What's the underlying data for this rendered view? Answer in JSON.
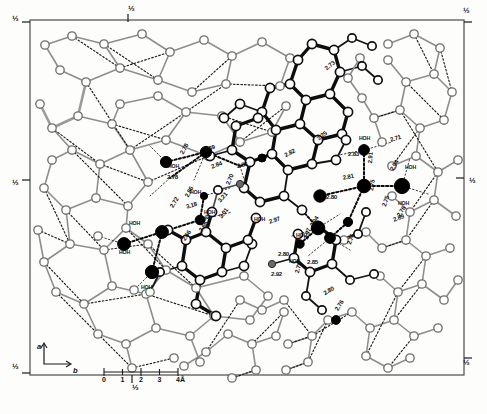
{
  "figure": {
    "kind": "crystal-packing-diagram",
    "background_color": "#fdfdfb",
    "frame_color": "#555555",
    "bond_color_light": "#888888",
    "bond_color_dark": "#111111",
    "atom_open_fill": "#ffffff",
    "atom_dark_fill": "#000000",
    "hbond_style": "dotted"
  },
  "cell_frame": {
    "x": 30,
    "y": 20,
    "width": 434,
    "height": 355,
    "edge_ticks": [
      {
        "name": "top-half-tick",
        "label": "½",
        "x": 128,
        "y": 4,
        "edge": "top"
      },
      {
        "name": "top-right-half-tick",
        "label": "½",
        "x": 463,
        "y": 6,
        "edge": "top-right"
      },
      {
        "name": "top-left-half-tick",
        "label": "½",
        "x": 12,
        "y": 14,
        "edge": "top-left"
      },
      {
        "name": "left-half-tick",
        "label": "½",
        "x": 12,
        "y": 178,
        "edge": "left"
      },
      {
        "name": "right-half-tick",
        "label": "½",
        "x": 469,
        "y": 176,
        "edge": "right"
      },
      {
        "name": "bottom-left-half-tick",
        "label": "½",
        "x": 12,
        "y": 362,
        "edge": "bottom-left"
      },
      {
        "name": "bottom-half-tick",
        "label": "½",
        "x": 132,
        "y": 383,
        "edge": "bottom"
      },
      {
        "name": "bottom-right-half-tick",
        "label": "½",
        "x": 463,
        "y": 358,
        "edge": "bottom-right"
      }
    ]
  },
  "axes": {
    "origin_label": "a",
    "horizontal_label": "b",
    "x": 44,
    "y": 352
  },
  "scale_bar": {
    "x": 104,
    "y": 372,
    "length_px": 74,
    "tick_labels": [
      "0",
      "1",
      "2",
      "3",
      "4Å"
    ],
    "unit": "Å"
  },
  "water_labels": [
    {
      "text": "HOH",
      "x": 168,
      "y": 163
    },
    {
      "text": "HOH",
      "x": 190,
      "y": 189
    },
    {
      "text": "HOH",
      "x": 129,
      "y": 220
    },
    {
      "text": "HOH",
      "x": 254,
      "y": 216
    },
    {
      "text": "HOH",
      "x": 119,
      "y": 249
    },
    {
      "text": "HOH",
      "x": 141,
      "y": 284
    },
    {
      "text": "HOH",
      "x": 359,
      "y": 135
    },
    {
      "text": "HOH",
      "x": 405,
      "y": 164
    },
    {
      "text": "HOH",
      "x": 296,
      "y": 232
    },
    {
      "text": "HOH",
      "x": 398,
      "y": 200
    },
    {
      "text": "HOH",
      "x": 289,
      "y": 258
    },
    {
      "text": "HOH",
      "x": 204,
      "y": 209
    }
  ],
  "distance_labels": [
    {
      "value": "2.78",
      "x": 178,
      "y": 152,
      "rot": -62
    },
    {
      "value": "2.89",
      "x": 203,
      "y": 146,
      "rot": -16
    },
    {
      "value": "2.78",
      "x": 167,
      "y": 173,
      "rot": 0
    },
    {
      "value": "2.84",
      "x": 210,
      "y": 163,
      "rot": -20
    },
    {
      "value": "2.86",
      "x": 236,
      "y": 162,
      "rot": -11
    },
    {
      "value": "2.70",
      "x": 224,
      "y": 183,
      "rot": -68
    },
    {
      "value": "3.21",
      "x": 216,
      "y": 199,
      "rot": -50
    },
    {
      "value": "2.86",
      "x": 183,
      "y": 195,
      "rot": -63
    },
    {
      "value": "2.72",
      "x": 168,
      "y": 205,
      "rot": -58
    },
    {
      "value": "3.18",
      "x": 185,
      "y": 203,
      "rot": -16
    },
    {
      "value": "2.90",
      "x": 197,
      "y": 219,
      "rot": -35
    },
    {
      "value": "2.66",
      "x": 197,
      "y": 229,
      "rot": -58
    },
    {
      "value": "3.01",
      "x": 217,
      "y": 215,
      "rot": -52
    },
    {
      "value": "2.66",
      "x": 180,
      "y": 238,
      "rot": -56
    },
    {
      "value": "3.25",
      "x": 315,
      "y": 136,
      "rot": -38
    },
    {
      "value": "2.82",
      "x": 283,
      "y": 152,
      "rot": -28
    },
    {
      "value": "2.73",
      "x": 323,
      "y": 66,
      "rot": -40
    },
    {
      "value": "2.83",
      "x": 348,
      "y": 150,
      "rot": 0
    },
    {
      "value": "2.71",
      "x": 389,
      "y": 136,
      "rot": -16
    },
    {
      "value": "2.91",
      "x": 366,
      "y": 163,
      "rot": -86
    },
    {
      "value": "2.94",
      "x": 388,
      "y": 168,
      "rot": -60
    },
    {
      "value": "2.81",
      "x": 342,
      "y": 174,
      "rot": -12
    },
    {
      "value": "2.80",
      "x": 326,
      "y": 193,
      "rot": 0
    },
    {
      "value": "2.75",
      "x": 367,
      "y": 190,
      "rot": -80
    },
    {
      "value": "2.75",
      "x": 380,
      "y": 205,
      "rot": -70
    },
    {
      "value": "2.76",
      "x": 395,
      "y": 214,
      "rot": -58
    },
    {
      "value": "2.89",
      "x": 392,
      "y": 216,
      "rot": -20
    },
    {
      "value": "2.97",
      "x": 268,
      "y": 218,
      "rot": -18
    },
    {
      "value": "2.94",
      "x": 308,
      "y": 224,
      "rot": -58
    },
    {
      "value": "2.97",
      "x": 302,
      "y": 238,
      "rot": -74
    },
    {
      "value": "2.80",
      "x": 278,
      "y": 250,
      "rot": 0
    },
    {
      "value": "2.85",
      "x": 307,
      "y": 258,
      "rot": 0
    },
    {
      "value": "2.92",
      "x": 271,
      "y": 270,
      "rot": 0
    },
    {
      "value": "2.78",
      "x": 293,
      "y": 272,
      "rot": -76
    },
    {
      "value": "2.76",
      "x": 333,
      "y": 308,
      "rot": -58
    },
    {
      "value": "2.76",
      "x": 345,
      "y": 243,
      "rot": -70
    },
    {
      "value": "2.80",
      "x": 322,
      "y": 290,
      "rot": -30
    }
  ],
  "chart_data": {
    "type": "scatter",
    "title": "",
    "xlabel": "b",
    "ylabel": "a"
  }
}
